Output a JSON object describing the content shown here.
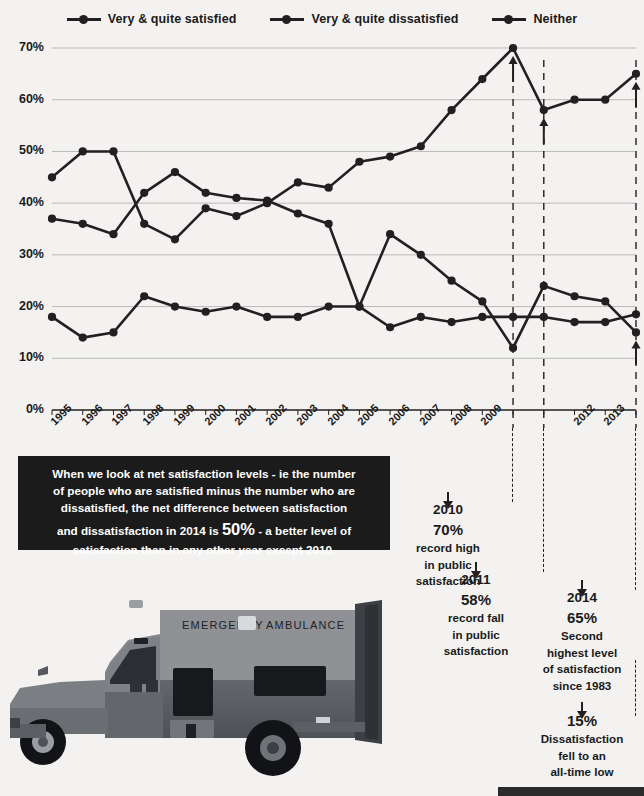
{
  "legend": {
    "items": [
      {
        "label": "Very & quite satisfied",
        "color": "#231f20"
      },
      {
        "label": "Very & quite dissatisfied",
        "color": "#231f20"
      },
      {
        "label": "Neither",
        "color": "#231f20"
      }
    ]
  },
  "chart_data": {
    "type": "line",
    "title": "",
    "xlabel": "",
    "ylabel": "",
    "ylim": [
      0,
      70
    ],
    "yticks": [
      "0%",
      "10%",
      "20%",
      "30%",
      "40%",
      "50%",
      "60%",
      "70%"
    ],
    "ytick_values": [
      0,
      10,
      20,
      30,
      40,
      50,
      60,
      70
    ],
    "grid": true,
    "legend_position": "top",
    "categories": [
      1995,
      1996,
      1997,
      1998,
      1999,
      2000,
      2001,
      2002,
      2003,
      2004,
      2005,
      2006,
      2007,
      2008,
      2009,
      2010,
      2011,
      2012,
      2013,
      2014
    ],
    "xtick_labels": [
      "1995",
      "1996",
      "1997",
      "1998",
      "1999",
      "2000",
      "2001",
      "2002",
      "2003",
      "2004",
      "2005",
      "2006",
      "2007",
      "2008",
      "2009",
      "",
      "",
      "2012",
      "2013",
      ""
    ],
    "series": [
      {
        "name": "Very & quite satisfied",
        "color": "#231f20",
        "values": [
          45,
          50,
          50,
          36,
          33,
          39,
          37.5,
          40,
          44,
          43,
          48,
          49,
          51,
          58,
          64,
          70,
          58,
          60,
          60,
          65
        ]
      },
      {
        "name": "Very & quite dissatisfied",
        "color": "#231f20",
        "values": [
          37,
          36,
          34,
          42,
          46,
          42,
          41,
          40.5,
          38,
          36,
          20,
          34,
          30,
          25,
          21,
          12,
          24,
          22,
          21,
          15
        ]
      },
      {
        "name": "Neither",
        "color": "#231f20",
        "values": [
          18,
          14,
          15,
          22,
          20,
          19,
          20,
          18,
          18,
          20,
          20,
          16,
          18,
          17,
          18,
          18,
          18,
          17,
          17,
          18.5
        ]
      }
    ],
    "annotations": [
      {
        "year": 2010,
        "value": 70,
        "label": "2010 70% record high in public satisfaction"
      },
      {
        "year": 2011,
        "value": 58,
        "label": "2011 58% record fall in public satisfaction"
      },
      {
        "year": 2014,
        "value": 65,
        "label": "2014 65% Second highest level of satisfaction since 1983"
      },
      {
        "year": 2014,
        "value": 15,
        "label": "15% Dissatisfaction fell to an all-time low"
      }
    ]
  },
  "infobox": {
    "line1": "When we look at net satisfaction levels - ie the number",
    "line2": "of people who are satisfied minus the number who are",
    "line3": "dissatisfied, the net difference between satisfaction",
    "line4_pre": "and dissatisfaction in 2014 is ",
    "line4_big": "50%",
    "line4_post": " - a better level of",
    "line5": "satisfaction than in any other year except 2010."
  },
  "callouts": {
    "c2010": {
      "year": "2010",
      "pct": "70%",
      "l1": "record high",
      "l2": "in public",
      "l3": "satisfaction"
    },
    "c2011": {
      "year": "2011",
      "pct": "58%",
      "l1": "record fall",
      "l2": "in public",
      "l3": "satisfaction"
    },
    "c2014": {
      "year": "2014",
      "pct": "65%",
      "l1": "Second",
      "l2": "highest level",
      "l3": "of satisfaction",
      "l4": "since 1983"
    },
    "c15": {
      "pct": "15%",
      "l1": "Dissatisfaction",
      "l2": "fell to an",
      "l3": "all-time low"
    }
  },
  "photo": {
    "alt": "ambulance-photo",
    "text_left": "EMERGENCY",
    "text_right": "AMBULANCE"
  },
  "colors": {
    "background": "#f3f2f0",
    "ink": "#231f20",
    "grid": "#b9b9b9",
    "infobox_bg": "#1b1b1b"
  }
}
